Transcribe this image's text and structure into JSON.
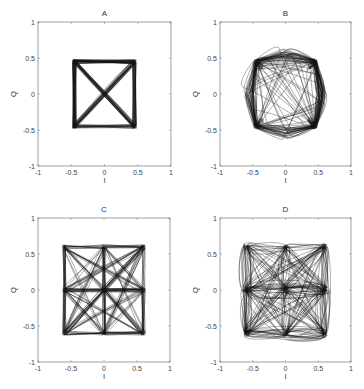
{
  "figure": {
    "panels": [
      "A",
      "B",
      "C",
      "D"
    ]
  },
  "chart_data": [
    {
      "type": "line",
      "title": "A",
      "xlabel": "I",
      "ylabel": "Q",
      "xlim": [
        -1,
        1
      ],
      "ylim": [
        -1,
        1
      ],
      "xticks": [
        -1,
        -0.5,
        0,
        0.5,
        1
      ],
      "yticks": [
        -1,
        -0.5,
        0,
        0.5,
        1
      ],
      "xtick_labels": [
        "-1",
        "-0.5",
        "0",
        "0.5",
        "1"
      ],
      "ytick_labels": [
        "-1",
        "-0.5",
        "0",
        "0.5",
        "1"
      ],
      "grid": false,
      "description": "QPSK I/Q trajectory: symbols at (±0.45, ±0.45), straight transitions including diagonals through origin",
      "constellation_points": [
        [
          -0.45,
          0.45
        ],
        [
          0.45,
          0.45
        ],
        [
          -0.45,
          -0.45
        ],
        [
          0.45,
          -0.45
        ]
      ],
      "trajectory_style": "straight"
    },
    {
      "type": "line",
      "title": "B",
      "xlabel": "I",
      "ylabel": "Q",
      "xlim": [
        -1,
        1
      ],
      "ylim": [
        -1,
        1
      ],
      "xticks": [
        -1,
        -0.5,
        0,
        0.5,
        1
      ],
      "yticks": [
        -1,
        -0.5,
        0,
        0.5,
        1
      ],
      "xtick_labels": [
        "-1",
        "-0.5",
        "0",
        "0.5",
        "1"
      ],
      "ytick_labels": [
        "-1",
        "-0.5",
        "0",
        "0.5",
        "1"
      ],
      "grid": false,
      "description": "Offset-QPSK I/Q trajectory: symbols at (±0.45, ±0.45), curved transitions avoiding origin (hole radius ~0.3)",
      "constellation_points": [
        [
          -0.45,
          0.45
        ],
        [
          0.45,
          0.45
        ],
        [
          -0.45,
          -0.45
        ],
        [
          0.45,
          -0.45
        ]
      ],
      "trajectory_style": "circular",
      "inner_radius": 0.3
    },
    {
      "type": "line",
      "title": "C",
      "xlabel": "I",
      "ylabel": "Q",
      "xlim": [
        -1,
        1
      ],
      "ylim": [
        -1,
        1
      ],
      "xticks": [
        -1,
        -0.5,
        0,
        0.5,
        1
      ],
      "yticks": [
        -1,
        -0.5,
        0,
        0.5,
        1
      ],
      "xtick_labels": [
        "-1",
        "-0.5",
        "0",
        "0.5",
        "1"
      ],
      "ytick_labels": [
        "-1",
        "-0.5",
        "0",
        "0.5",
        "1"
      ],
      "grid": false,
      "description": "9-point (3x3) constellation trajectory with levels {-0.6, 0, 0.6}, straight transitions",
      "constellation_points": [
        [
          -0.6,
          0.6
        ],
        [
          0,
          0.6
        ],
        [
          0.6,
          0.6
        ],
        [
          -0.6,
          0
        ],
        [
          0,
          0
        ],
        [
          0.6,
          0
        ],
        [
          -0.6,
          -0.6
        ],
        [
          0,
          -0.6
        ],
        [
          0.6,
          -0.6
        ]
      ],
      "trajectory_style": "straight"
    },
    {
      "type": "line",
      "title": "D",
      "xlabel": "I",
      "ylabel": "Q",
      "xlim": [
        -1,
        1
      ],
      "ylim": [
        -1,
        1
      ],
      "xticks": [
        -1,
        -0.5,
        0,
        0.5,
        1
      ],
      "yticks": [
        -1,
        -0.5,
        0,
        0.5,
        1
      ],
      "xtick_labels": [
        "-1",
        "-0.5",
        "0",
        "0.5",
        "1"
      ],
      "ytick_labels": [
        "-1",
        "-0.5",
        "0",
        "0.5",
        "1"
      ],
      "grid": false,
      "description": "9-point (3x3) constellation trajectory with levels {-0.6, 0, 0.6}, curved looping transitions leaving four empty quadrant holes",
      "constellation_points": [
        [
          -0.6,
          0.6
        ],
        [
          0,
          0.6
        ],
        [
          0.6,
          0.6
        ],
        [
          -0.6,
          0
        ],
        [
          0,
          0
        ],
        [
          0.6,
          0
        ],
        [
          -0.6,
          -0.6
        ],
        [
          0,
          -0.6
        ],
        [
          0.6,
          -0.6
        ]
      ],
      "trajectory_style": "curved"
    }
  ]
}
